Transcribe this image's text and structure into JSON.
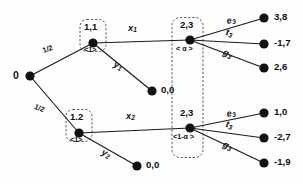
{
  "diagram": {
    "root": {
      "label": "0"
    },
    "chance_probabilities": [
      {
        "id": "p-upper",
        "label": "1/2"
      },
      {
        "id": "p-lower",
        "label": "1/2"
      }
    ],
    "decision_nodes": [
      {
        "id": "n11",
        "label": "1,1",
        "type_label": "<1>"
      },
      {
        "id": "n12",
        "label": "1.2",
        "type_label": "<1>"
      },
      {
        "id": "n23top",
        "label": "2,3",
        "type_label": "< α >"
      },
      {
        "id": "n23bot",
        "label": "2,3",
        "type_label": "<1-α >"
      }
    ],
    "actions": {
      "x1": "x",
      "x1_sub": "1",
      "y1": "y",
      "y1_sub": "1",
      "x2": "x",
      "x2_sub": "2",
      "y2": "y",
      "y2_sub": "2",
      "e_top": "e",
      "e_top_sub": "3",
      "t_top": "t",
      "t_top_sub": "3",
      "g_top": "g",
      "g_top_sub": "3",
      "e_bot": "e",
      "e_bot_sub": "3",
      "t_bot": "t",
      "t_bot_sub": "3",
      "g_bot": "g",
      "g_bot_sub": "3"
    },
    "terminal_payoffs": [
      {
        "id": "t-top-1",
        "label": "3,8"
      },
      {
        "id": "t-top-2",
        "label": "-1,7"
      },
      {
        "id": "t-top-3",
        "label": "2,6"
      },
      {
        "id": "t-y1",
        "label": "0,0"
      },
      {
        "id": "t-bot-1",
        "label": "1,0"
      },
      {
        "id": "t-bot-2",
        "label": "-2,7"
      },
      {
        "id": "t-bot-3",
        "label": "-1,9"
      },
      {
        "id": "t-y2",
        "label": "0,0"
      }
    ],
    "colors": {
      "ink": "#111111",
      "edge": "#1a1a1a",
      "dash": "#444444",
      "background": "#fefefe"
    }
  }
}
